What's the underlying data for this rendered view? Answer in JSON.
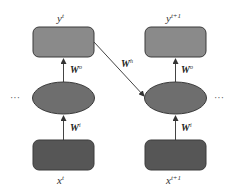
{
  "diagram": {
    "type": "rnn-unrolled",
    "colors": {
      "output_box": "#8a8a8a",
      "hidden_node": "#6e6e6e",
      "input_box": "#565656",
      "stroke": "#3a3a3a",
      "arrow": "#444444",
      "background": "#ffffff"
    },
    "left_dots": "···",
    "right_dots": "···",
    "columns": [
      {
        "output": {
          "base": "y",
          "sup": "t"
        },
        "output_weight": {
          "base": "W",
          "sup": "o"
        },
        "input_weight": {
          "base": "W",
          "sup": "i"
        },
        "input": {
          "base": "x",
          "sup": "t"
        }
      },
      {
        "output": {
          "base": "y",
          "sup": "t+1"
        },
        "output_weight": {
          "base": "W",
          "sup": "o"
        },
        "input_weight": {
          "base": "W",
          "sup": "i"
        },
        "input": {
          "base": "x",
          "sup": "t+1"
        }
      }
    ],
    "recurrent_weight": {
      "base": "W",
      "sup": "h"
    }
  }
}
